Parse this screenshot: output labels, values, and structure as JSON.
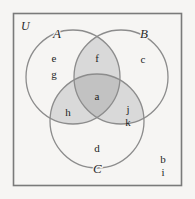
{
  "diagram": {
    "type": "venn-3-set",
    "universe": {
      "label": "U",
      "outside_elements": [
        "b",
        "i"
      ]
    },
    "sets": [
      {
        "id": "A",
        "label": "A",
        "only_elements": [
          "e",
          "g"
        ]
      },
      {
        "id": "B",
        "label": "B",
        "only_elements": [
          "c"
        ]
      },
      {
        "id": "C",
        "label": "C",
        "only_elements": [
          "d"
        ]
      }
    ],
    "regions": [
      {
        "id": "A-only",
        "name": "A only",
        "elements": [
          "e",
          "g"
        ],
        "shade": "none"
      },
      {
        "id": "B-only",
        "name": "B only",
        "elements": [
          "c"
        ],
        "shade": "none"
      },
      {
        "id": "C-only",
        "name": "C only",
        "elements": [
          "d"
        ],
        "shade": "none"
      },
      {
        "id": "AB",
        "name": "A and B",
        "elements": [
          "f"
        ],
        "shade": "light"
      },
      {
        "id": "AC",
        "name": "A and C",
        "elements": [
          "h"
        ],
        "shade": "light"
      },
      {
        "id": "BC",
        "name": "B and C",
        "elements": [
          "j",
          "k"
        ],
        "shade": "light"
      },
      {
        "id": "ABC",
        "name": "A and B and C",
        "elements": [
          "a"
        ],
        "shade": "dark"
      },
      {
        "id": "outside",
        "name": "outside all sets",
        "elements": [
          "b",
          "i"
        ],
        "shade": "none"
      }
    ],
    "labels": {
      "universe": "U",
      "set_a": "A",
      "set_b": "B",
      "set_c": "C",
      "a_only_1": "e",
      "a_only_2": "g",
      "b_only_1": "c",
      "c_only_1": "d",
      "ab_1": "f",
      "ac_1": "h",
      "bc_1": "j",
      "bc_2": "k",
      "abc_1": "a",
      "outside_1": "b",
      "outside_2": "i"
    },
    "colors": {
      "background": "#f6f5f3",
      "frame_stroke": "#7a7a7a",
      "circle_stroke": "#8c8c8c",
      "fill_none": "#f6f5f3",
      "fill_light": "#d9d9d9",
      "fill_dark": "#c2c2c2",
      "text": "#1f1f1f"
    }
  }
}
